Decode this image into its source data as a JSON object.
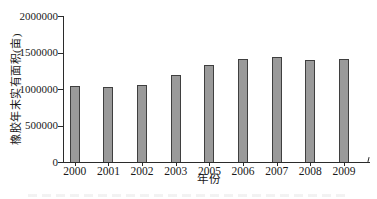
{
  "chart_data": {
    "type": "bar",
    "title": "",
    "categories": [
      "2000",
      "2001",
      "2002",
      "2003",
      "2005",
      "2006",
      "2007",
      "2008",
      "2009"
    ],
    "values": [
      1035000,
      1030000,
      1060000,
      1195000,
      1330000,
      1405000,
      1435000,
      1395000,
      1405000
    ],
    "xlabel": "年份",
    "ylabel": "橡胶年末实有面积(亩)",
    "ylim": [
      0,
      2000000
    ],
    "yticks": [
      0,
      500000,
      1000000,
      1500000,
      2000000
    ],
    "ytick_labels": [
      "0",
      "500000",
      "1000000",
      "1500000",
      "2000000"
    ],
    "grid": false,
    "legend_position": "none",
    "bar_color": "#9a9a9a",
    "bar_border_color": "#3f3f3f",
    "axis_color": "#2b2b2b",
    "text_color": "#1a1a1a"
  }
}
